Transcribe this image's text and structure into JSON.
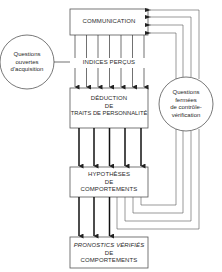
{
  "diagram": {
    "type": "flowchart",
    "boxes": {
      "communication": {
        "label": "COMMUNICATION"
      },
      "deduction": {
        "line1": "DÉDUCTION",
        "line2": "DE",
        "line3": "TRAITS DE PERSONNALITÉ"
      },
      "hypotheses": {
        "line1": "HYPOTHÈSES",
        "line2": "DE",
        "line3": "COMPORTEMENTS"
      },
      "pronostics": {
        "line1": "PRONOSTICS VÉRIFIÉS",
        "line2": "DE",
        "line3": "COMPORTEMENTS"
      }
    },
    "circles": {
      "open_questions": {
        "line1": "Questions",
        "line2": "ouvertes",
        "line3": "d'acquisition"
      },
      "closed_questions": {
        "line1": "Questions",
        "line2": "fermées",
        "line3": "de contrôle-",
        "line4": "vérification"
      }
    },
    "annotations": {
      "indices": "INDICES PERÇUS"
    },
    "edges": [
      {
        "from": "communication",
        "to": "deduction",
        "count": 7,
        "style": "thin-arrow"
      },
      {
        "from": "open_questions",
        "to": "indices",
        "count": 1,
        "style": "thin-arrow"
      },
      {
        "from": "deduction",
        "to": "hypotheses",
        "count": 5,
        "style": "thick-arrow"
      },
      {
        "from": "hypotheses",
        "to": "pronostics",
        "count": 3,
        "style": "thick-arrow"
      },
      {
        "from": "hypotheses",
        "to": "communication",
        "count": 4,
        "style": "feedback-loop",
        "via": "closed_questions"
      }
    ],
    "colors": {
      "line": "#3a3a3a",
      "text": "#2a2a2a",
      "background": "#ffffff"
    }
  }
}
